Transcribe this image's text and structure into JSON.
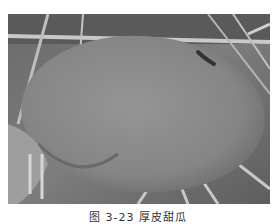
{
  "figure": {
    "caption": "图 3-23  厚皮甜瓜"
  },
  "colors": {
    "fruit": "#8c8c8c",
    "background_dark": "#555555",
    "grass_light": "#c8c8c8",
    "page": "#ffffff"
  }
}
